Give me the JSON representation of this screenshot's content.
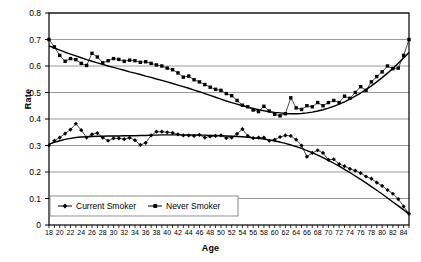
{
  "chart_data": {
    "type": "line",
    "title": "",
    "xlabel": "Age",
    "ylabel": "Rate",
    "xlim": [
      18,
      85
    ],
    "ylim": [
      0,
      0.8
    ],
    "ytick_labels": [
      "0",
      "0.1",
      "0.2",
      "0.3",
      "0.4",
      "0.5",
      "0.6",
      "0.7",
      "0.8"
    ],
    "ytick_values": [
      0,
      0.1,
      0.2,
      0.3,
      0.4,
      0.5,
      0.6,
      0.7,
      0.8
    ],
    "xtick_labels": [
      "18",
      "20",
      "22",
      "24",
      "26",
      "28",
      "30",
      "32",
      "34",
      "36",
      "38",
      "40",
      "42",
      "44",
      "46",
      "48",
      "50",
      "52",
      "54",
      "56",
      "58",
      "60",
      "62",
      "64",
      "66",
      "68",
      "70",
      "72",
      "74",
      "76",
      "78",
      "80",
      "82",
      "84"
    ],
    "xtick_values": [
      18,
      20,
      22,
      24,
      26,
      28,
      30,
      32,
      34,
      36,
      38,
      40,
      42,
      44,
      46,
      48,
      50,
      52,
      54,
      56,
      58,
      60,
      62,
      64,
      66,
      68,
      70,
      72,
      74,
      76,
      78,
      80,
      82,
      84
    ],
    "minor_ticks_every": 1,
    "grid": "horizontal",
    "grid_color": "#808080",
    "frame_color": "#000000",
    "legend_position": "bottom-left-inside",
    "series": [
      {
        "name": "Current Smoker",
        "marker": "diamond",
        "color": "#000000",
        "x": [
          18,
          19,
          20,
          21,
          22,
          23,
          24,
          25,
          26,
          27,
          28,
          29,
          30,
          31,
          32,
          33,
          34,
          35,
          36,
          37,
          38,
          39,
          40,
          41,
          42,
          43,
          44,
          45,
          46,
          47,
          48,
          49,
          50,
          51,
          52,
          53,
          54,
          55,
          56,
          57,
          58,
          59,
          60,
          61,
          62,
          63,
          64,
          65,
          66,
          67,
          68,
          69,
          70,
          71,
          72,
          73,
          74,
          75,
          76,
          77,
          78,
          79,
          80,
          81,
          82,
          83,
          84,
          85
        ],
        "values": [
          0.3,
          0.318,
          0.33,
          0.345,
          0.36,
          0.382,
          0.358,
          0.33,
          0.342,
          0.347,
          0.33,
          0.318,
          0.327,
          0.327,
          0.324,
          0.329,
          0.32,
          0.302,
          0.31,
          0.338,
          0.352,
          0.352,
          0.35,
          0.348,
          0.342,
          0.338,
          0.338,
          0.336,
          0.34,
          0.33,
          0.334,
          0.336,
          0.338,
          0.328,
          0.33,
          0.344,
          0.362,
          0.336,
          0.328,
          0.33,
          0.33,
          0.318,
          0.322,
          0.332,
          0.338,
          0.336,
          0.322,
          0.3,
          0.258,
          0.272,
          0.282,
          0.272,
          0.246,
          0.248,
          0.23,
          0.222,
          0.212,
          0.205,
          0.196,
          0.183,
          0.175,
          0.16,
          0.148,
          0.132,
          0.118,
          0.098,
          0.07,
          0.042
        ],
        "trend": [
          0.305,
          0.312,
          0.318,
          0.323,
          0.327,
          0.33,
          0.332,
          0.333,
          0.334,
          0.335,
          0.335,
          0.336,
          0.336,
          0.336,
          0.337,
          0.337,
          0.337,
          0.338,
          0.338,
          0.339,
          0.339,
          0.34,
          0.34,
          0.34,
          0.34,
          0.34,
          0.34,
          0.34,
          0.339,
          0.339,
          0.338,
          0.338,
          0.337,
          0.336,
          0.335,
          0.334,
          0.333,
          0.331,
          0.329,
          0.327,
          0.324,
          0.321,
          0.317,
          0.313,
          0.308,
          0.302,
          0.296,
          0.289,
          0.281,
          0.273,
          0.264,
          0.254,
          0.244,
          0.233,
          0.222,
          0.21,
          0.198,
          0.185,
          0.172,
          0.159,
          0.145,
          0.131,
          0.117,
          0.102,
          0.087,
          0.072,
          0.057,
          0.042
        ]
      },
      {
        "name": "Never Smoker",
        "marker": "square",
        "color": "#000000",
        "x": [
          18,
          19,
          20,
          21,
          22,
          23,
          24,
          25,
          26,
          27,
          28,
          29,
          30,
          31,
          32,
          33,
          34,
          35,
          36,
          37,
          38,
          39,
          40,
          41,
          42,
          43,
          44,
          45,
          46,
          47,
          48,
          49,
          50,
          51,
          52,
          53,
          54,
          55,
          56,
          57,
          58,
          59,
          60,
          61,
          62,
          63,
          64,
          65,
          66,
          67,
          68,
          69,
          70,
          71,
          72,
          73,
          74,
          75,
          76,
          77,
          78,
          79,
          80,
          81,
          82,
          83,
          84,
          85
        ],
        "values": [
          0.7,
          0.672,
          0.64,
          0.618,
          0.628,
          0.624,
          0.61,
          0.602,
          0.648,
          0.634,
          0.612,
          0.62,
          0.628,
          0.625,
          0.618,
          0.622,
          0.62,
          0.614,
          0.616,
          0.61,
          0.604,
          0.6,
          0.592,
          0.586,
          0.574,
          0.558,
          0.562,
          0.548,
          0.54,
          0.53,
          0.52,
          0.512,
          0.508,
          0.496,
          0.488,
          0.47,
          0.452,
          0.446,
          0.434,
          0.428,
          0.448,
          0.43,
          0.418,
          0.412,
          0.42,
          0.48,
          0.442,
          0.436,
          0.45,
          0.446,
          0.462,
          0.45,
          0.462,
          0.47,
          0.462,
          0.486,
          0.478,
          0.5,
          0.522,
          0.508,
          0.54,
          0.56,
          0.578,
          0.6,
          0.59,
          0.592,
          0.64,
          0.7
        ],
        "trend": [
          0.676,
          0.668,
          0.66,
          0.652,
          0.645,
          0.638,
          0.631,
          0.624,
          0.618,
          0.612,
          0.606,
          0.6,
          0.595,
          0.589,
          0.584,
          0.578,
          0.573,
          0.568,
          0.562,
          0.557,
          0.551,
          0.546,
          0.54,
          0.534,
          0.528,
          0.522,
          0.516,
          0.509,
          0.503,
          0.496,
          0.489,
          0.482,
          0.475,
          0.468,
          0.462,
          0.456,
          0.45,
          0.445,
          0.44,
          0.435,
          0.431,
          0.428,
          0.425,
          0.423,
          0.421,
          0.42,
          0.42,
          0.421,
          0.423,
          0.426,
          0.43,
          0.435,
          0.441,
          0.448,
          0.456,
          0.465,
          0.475,
          0.486,
          0.498,
          0.511,
          0.525,
          0.54,
          0.556,
          0.573,
          0.591,
          0.61,
          0.63,
          0.651
        ]
      }
    ]
  }
}
